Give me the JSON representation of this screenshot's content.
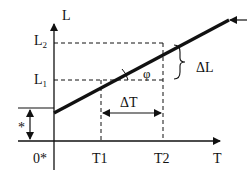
{
  "diagram": {
    "type": "linear thermal expansion graph",
    "axes": {
      "y_label": "L",
      "x_label": "T",
      "origin_label": "0*"
    },
    "y_ticks": [
      {
        "label": "L",
        "sub": "2"
      },
      {
        "label": "L",
        "sub": "1"
      }
    ],
    "x_ticks": [
      "T1",
      "T2"
    ],
    "annotations": {
      "delta_t": "ΔT",
      "delta_l": "ΔL",
      "angle": "φ",
      "offset_marker": "*"
    },
    "colors": {
      "line": "#111111",
      "background": "#ffffff"
    }
  }
}
